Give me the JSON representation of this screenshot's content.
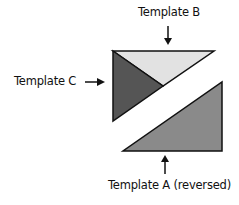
{
  "labels": {
    "template_b": "Template B",
    "template_c": "Template C",
    "template_a": "Template A (reversed)"
  },
  "colors": {
    "template_b_fill": "#e2e2e2",
    "template_c_fill": "#555555",
    "template_a_fill": "#8a8a8a",
    "stroke": "#111111"
  }
}
